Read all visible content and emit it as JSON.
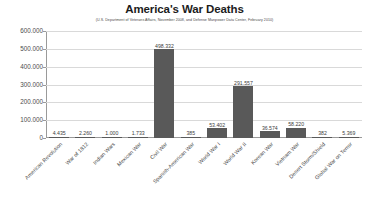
{
  "chart_data": {
    "type": "bar",
    "title": "America's War Deaths",
    "subtitle": "(U.S. Department of Veterans Affairs, November 2008, and Defense Manpower Data Center, February 2010)",
    "xlabel": "",
    "ylabel": "",
    "ylim": [
      0,
      600000
    ],
    "grid": true,
    "legend": "none",
    "bar_color": "#595959",
    "categories": [
      "American Revolution",
      "War of 1812",
      "Indian Wars",
      "Mexican War",
      "Civil War",
      "Spanish-American War",
      "World War I",
      "World War II",
      "Korean War",
      "Vietnam War",
      "Desert Storm/Shield",
      "Global War on Terror"
    ],
    "values": [
      4435,
      2260,
      1000,
      1733,
      498332,
      385,
      53402,
      291557,
      36574,
      58220,
      382,
      5369
    ],
    "value_labels": [
      "4.435",
      "2.260",
      "1.000",
      "1.733",
      "498.332",
      "385",
      "53.402",
      "291.557",
      "36.574",
      "58.220",
      "382",
      "5.369"
    ],
    "ytick_values": [
      0,
      100000,
      200000,
      300000,
      400000,
      500000,
      600000
    ],
    "ytick_labels": [
      "0",
      "100.000",
      "200.000",
      "300.000",
      "400.000",
      "500.000",
      "600.000"
    ]
  }
}
